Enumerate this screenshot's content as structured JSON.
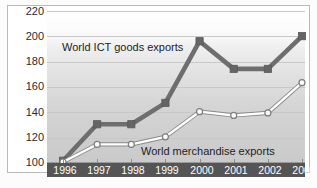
{
  "chart_data": {
    "type": "line",
    "title": "",
    "subtitle": "",
    "xlabel": "",
    "ylabel": "",
    "categories": [
      "1996",
      "1997",
      "1998",
      "1999",
      "2000",
      "2001",
      "2002",
      "2003"
    ],
    "ylim": [
      100,
      220
    ],
    "yticks": [
      100,
      120,
      140,
      160,
      180,
      200,
      220
    ],
    "grid": true,
    "legend_position": "inline-annotations",
    "series": [
      {
        "name": "World ICT goods exports",
        "marker": "square",
        "color": "#6b6b6b",
        "values": [
          101,
          130,
          130,
          147,
          196,
          174,
          174,
          200
        ]
      },
      {
        "name": "World merchandise exports",
        "marker": "circle",
        "color": "#f2f2f2",
        "values": [
          100,
          114,
          114,
          120,
          140,
          137,
          139,
          163
        ]
      }
    ],
    "annotations": [
      {
        "text": "World ICT goods exports",
        "series": "World ICT goods exports"
      },
      {
        "text": "World merchandise exports",
        "series": "World merchandise exports"
      }
    ]
  },
  "axis": {
    "y_labels": [
      "220",
      "200",
      "180",
      "160",
      "140",
      "120",
      "100"
    ],
    "x_labels": [
      "1996",
      "1997",
      "1998",
      "1999",
      "2000",
      "2001",
      "2002",
      "2003"
    ]
  },
  "labels": {
    "ict": "World ICT goods exports",
    "merchandise": "World merchandise exports"
  },
  "colors": {
    "ict_line": "#6b6b6b",
    "merchandise_line": "#ffffff",
    "merchandise_outline": "#8a8a8a",
    "axis_band": "#555555",
    "gridline": "#c8c8c8",
    "text": "#2b2b2b"
  }
}
